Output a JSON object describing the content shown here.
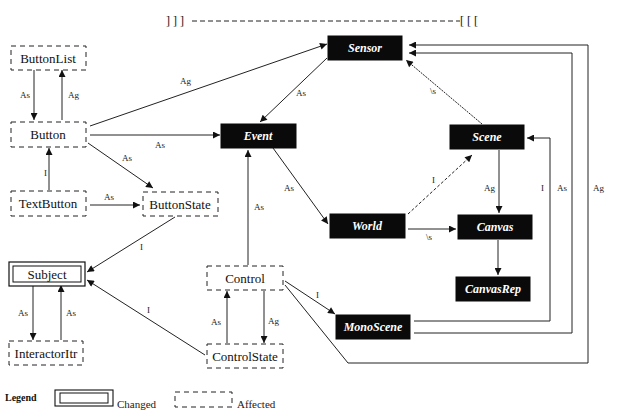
{
  "header": {
    "left_brackets": "] ] ]",
    "right_brackets": "[ [ ["
  },
  "nodes": {
    "buttonlist": {
      "label": "ButtonList",
      "style": "affected"
    },
    "button": {
      "label": "Button",
      "style": "affected"
    },
    "textbutton": {
      "label": "TextButton",
      "style": "affected"
    },
    "buttonstate": {
      "label": "ButtonState",
      "style": "affected"
    },
    "subject": {
      "label": "Subject",
      "style": "changed"
    },
    "interactoritr": {
      "label": "InteractorItr",
      "style": "affected"
    },
    "control": {
      "label": "Control",
      "style": "affected"
    },
    "controlstate": {
      "label": "ControlState",
      "style": "affected"
    },
    "sensor": {
      "label": "Sensor",
      "style": "unchanged"
    },
    "event": {
      "label": "Event",
      "style": "unchanged"
    },
    "scene": {
      "label": "Scene",
      "style": "unchanged"
    },
    "world": {
      "label": "World",
      "style": "unchanged"
    },
    "canvas": {
      "label": "Canvas",
      "style": "unchanged"
    },
    "canvasrep": {
      "label": "CanvasRep",
      "style": "unchanged"
    },
    "monoscene": {
      "label": "MonoScene",
      "style": "unchanged"
    }
  },
  "edges": [
    {
      "from": "ButtonList",
      "to": "Button",
      "label": "As"
    },
    {
      "from": "Button",
      "to": "ButtonList",
      "label": "Ag"
    },
    {
      "from": "Button",
      "to": "Sensor",
      "label": "Ag"
    },
    {
      "from": "Button",
      "to": "Event",
      "label": "As"
    },
    {
      "from": "Button",
      "to": "ButtonState",
      "label": "As"
    },
    {
      "from": "TextButton",
      "to": "Button",
      "label": "I"
    },
    {
      "from": "TextButton",
      "to": "ButtonState",
      "label": "As"
    },
    {
      "from": "ButtonState",
      "to": "Subject",
      "label": "I"
    },
    {
      "from": "Subject",
      "to": "InteractorItr",
      "label": "As"
    },
    {
      "from": "InteractorItr",
      "to": "Subject",
      "label": "As"
    },
    {
      "from": "ControlState",
      "to": "Subject",
      "label": "I"
    },
    {
      "from": "Sensor",
      "to": "Event",
      "label": "As"
    },
    {
      "from": "Scene",
      "to": "Sensor",
      "label": "As"
    },
    {
      "from": "Event",
      "to": "World",
      "label": "As"
    },
    {
      "from": "World",
      "to": "Scene",
      "label": "I"
    },
    {
      "from": "World",
      "to": "Canvas",
      "label": "As"
    },
    {
      "from": "Scene",
      "to": "Canvas",
      "label": "Ag"
    },
    {
      "from": "Canvas",
      "to": "CanvasRep",
      "label": ""
    },
    {
      "from": "Control",
      "to": "Event",
      "label": "As"
    },
    {
      "from": "ControlState",
      "to": "Control",
      "label": "As"
    },
    {
      "from": "Control",
      "to": "ControlState",
      "label": "Ag"
    },
    {
      "from": "Control",
      "to": "MonoScene",
      "label": "I"
    },
    {
      "from": "MonoScene",
      "to": "Scene",
      "label": "I"
    },
    {
      "from": "MonoScene",
      "to": "Sensor",
      "label": "As"
    },
    {
      "from": "Control",
      "to": "Sensor",
      "label": "Ag"
    }
  ],
  "edge_labels": {
    "as": "As",
    "ag": "Ag",
    "i": "I",
    "as_faint": "\\s"
  },
  "legend": {
    "title": "Legend",
    "changed": "Changed",
    "affected": "Affected"
  }
}
